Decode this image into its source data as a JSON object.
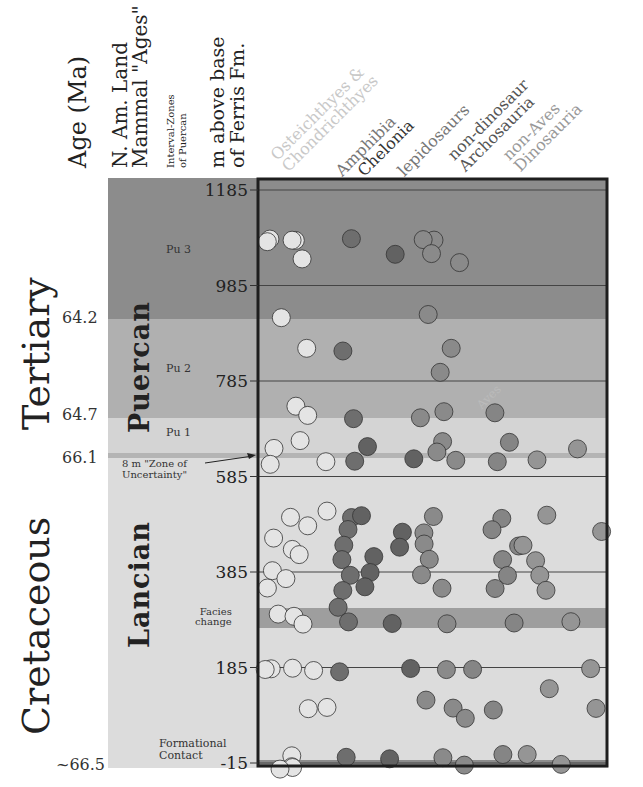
{
  "header": {
    "col_age": "Age (Ma)",
    "col_nalma_line1": "N. Am. Land",
    "col_nalma_line2": "Mammal \"Ages\"",
    "col_interval_line1": "Interval-Zones",
    "col_interval_line2": "of Puercan",
    "col_meters_line1": "m above base",
    "col_meters_line2": "of Ferris Fm."
  },
  "periods": {
    "tertiary": "Tertiary",
    "cretaceous": "Cretaceous"
  },
  "ages": {
    "puercan": "Puercan",
    "lancian": "Lancian"
  },
  "zones": {
    "pu3": "Pu 3",
    "pu2": "Pu 2",
    "pu1": "Pu 1"
  },
  "age_ticks": {
    "a1": "64.2",
    "a2": "64.7",
    "a3": "66.1",
    "a4": "~66.5"
  },
  "annotations": {
    "zone_uncertainty_line1": "8 m \"Zone of",
    "zone_uncertainty_line2": "Uncertainty\"",
    "facies_line1": "Facies",
    "facies_line2": "change",
    "formational_line1": "Formational",
    "formational_line2": "Contact",
    "aves": "Aves"
  },
  "taxa_headers": [
    {
      "line1": "Osteichthyes &",
      "line2": "Chondrichthyes",
      "color": "#c8c8c8"
    },
    {
      "line1": "Amphibia",
      "line2": "",
      "color": "#777777"
    },
    {
      "line1": "Chelonia",
      "line2": "",
      "color": "#333333"
    },
    {
      "line1": "lepidosaurs",
      "line2": "",
      "color": "#777777"
    },
    {
      "line1": "non-dinosaur",
      "line2": "Archosauria",
      "color": "#555555"
    },
    {
      "line1": "non-Aves",
      "line2": "Dinosauria",
      "color": "#999999"
    }
  ],
  "chart_data": {
    "type": "scatter",
    "title": "",
    "xlabel": "Taxonomic group",
    "ylabel": "m above base of Ferris Fm.",
    "y_ticks": [
      1185,
      985,
      785,
      585,
      385,
      185,
      -15
    ],
    "ylim": [
      -15,
      1185
    ],
    "x_categories": [
      "Osteichthyes & Chondrichthyes",
      "Amphibia",
      "Chelonia",
      "lepidosaurs",
      "non-dinosaur Archosauria",
      "Aves",
      "non-Aves Dinosauria"
    ],
    "age_boundaries_ma": [
      {
        "age": "64.2",
        "m": 890
      },
      {
        "age": "64.7",
        "m": 695
      },
      {
        "age": "66.1",
        "m": 622
      },
      {
        "age": "~66.5",
        "m": -15
      }
    ],
    "land_mammal_ages": [
      {
        "name": "Puercan",
        "from_m": 622,
        "to_m": 1185,
        "zones": [
          {
            "name": "Pu 3",
            "from_m": 890,
            "to_m": 1185
          },
          {
            "name": "Pu 2",
            "from_m": 695,
            "to_m": 890
          },
          {
            "name": "Pu 1",
            "from_m": 622,
            "to_m": 695
          }
        ]
      },
      {
        "name": "Lancian",
        "from_m": -15,
        "to_m": 622
      }
    ],
    "marker_levels": [
      {
        "label": "8 m Zone of Uncertainty",
        "m": 612
      },
      {
        "label": "Facies change",
        "m": 275
      },
      {
        "label": "Formational Contact",
        "m": -15
      }
    ],
    "series": [
      {
        "name": "Osteichthyes & Chondrichthyes",
        "color": "#e4e4e4",
        "points_m": [
          1080,
          1080,
          1080,
          1080,
          1040,
          920,
          850,
          730,
          710,
          660,
          640,
          620,
          610,
          510,
          500,
          480,
          460,
          430,
          420,
          390,
          370,
          355,
          300,
          290,
          275,
          180,
          180,
          180,
          180,
          100,
          100,
          0,
          -20,
          -25,
          -30
        ]
      },
      {
        "name": "Amphibia",
        "color": "#6e6e6e",
        "points_m": [
          1080,
          850,
          710,
          620,
          500,
          470,
          440,
          410,
          380,
          350,
          310,
          280,
          180,
          0
        ]
      },
      {
        "name": "Chelonia",
        "color": "#626262",
        "points_m": [
          1050,
          650,
          620,
          500,
          470,
          440,
          420,
          380,
          350,
          280,
          180,
          -10
        ]
      },
      {
        "name": "lepidosaurs",
        "color": "#8a8a8a",
        "points_m": [
          1080,
          1080,
          1050,
          1030,
          920,
          850,
          800,
          720,
          710,
          660,
          640,
          620,
          500,
          470,
          440,
          410,
          380,
          350,
          280,
          180,
          120,
          100,
          80,
          0,
          -20
        ]
      },
      {
        "name": "non-dinosaur Archosauria",
        "color": "#858585",
        "points_m": [
          720,
          660,
          620,
          500,
          470,
          440,
          410,
          380,
          350,
          280,
          180,
          100,
          0
        ]
      },
      {
        "name": "non-Aves Dinosauria",
        "color": "#959595",
        "points_m": [
          640,
          620,
          500,
          470,
          440,
          410,
          380,
          350,
          280,
          180,
          140,
          100,
          0,
          -20
        ]
      }
    ],
    "grid": true,
    "legend": "rotated column headers at top"
  }
}
